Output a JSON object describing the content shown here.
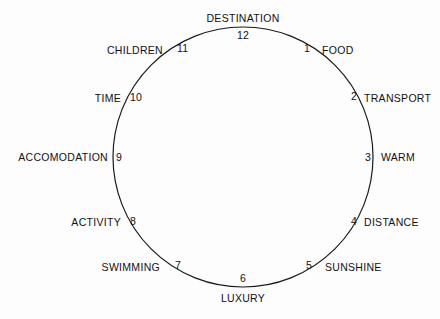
{
  "diagram": {
    "type": "clock-face-circle",
    "title": "",
    "background_color": "#fdfdfd",
    "stroke_color": "#1a1a1a",
    "text_color": "#111111",
    "circle": {
      "cx": 243,
      "cy": 157,
      "r": 130,
      "stroke_width": 1.2
    },
    "positions": [
      {
        "number": "12",
        "label": "DESTINATION",
        "hour": 12,
        "label_x": 243,
        "label_y": 18,
        "label_anchor": "center",
        "num_x": 243,
        "num_y": 35,
        "num_anchor": "center"
      },
      {
        "number": "1",
        "label": "FOOD",
        "hour": 1,
        "label_x": 322,
        "label_y": 50,
        "label_anchor": "left",
        "num_x": 310,
        "num_y": 48,
        "num_anchor": "right"
      },
      {
        "number": "2",
        "label": "TRANSPORT",
        "hour": 2,
        "label_x": 364,
        "label_y": 98,
        "label_anchor": "left",
        "num_x": 357,
        "num_y": 96,
        "num_anchor": "right"
      },
      {
        "number": "3",
        "label": "WARM",
        "hour": 3,
        "label_x": 381,
        "label_y": 157,
        "label_anchor": "left",
        "num_x": 371,
        "num_y": 157,
        "num_anchor": "right"
      },
      {
        "number": "4",
        "label": "DISTANCE",
        "hour": 4,
        "label_x": 364,
        "label_y": 222,
        "label_anchor": "left",
        "num_x": 357,
        "num_y": 221,
        "num_anchor": "right"
      },
      {
        "number": "5",
        "label": "SUNSHINE",
        "hour": 5,
        "label_x": 325,
        "label_y": 267,
        "label_anchor": "left",
        "num_x": 312,
        "num_y": 265,
        "num_anchor": "right"
      },
      {
        "number": "6",
        "label": "LUXURY",
        "hour": 6,
        "label_x": 243,
        "label_y": 298,
        "label_anchor": "center",
        "num_x": 243,
        "num_y": 278,
        "num_anchor": "center"
      },
      {
        "number": "7",
        "label": "SWIMMING",
        "hour": 7,
        "label_x": 160,
        "label_y": 267,
        "label_anchor": "right",
        "num_x": 175,
        "num_y": 265,
        "num_anchor": "left"
      },
      {
        "number": "8",
        "label": "ACTIVITY",
        "hour": 8,
        "label_x": 121,
        "label_y": 222,
        "label_anchor": "right",
        "num_x": 130,
        "num_y": 221,
        "num_anchor": "left"
      },
      {
        "number": "9",
        "label": "ACCOMODATION",
        "hour": 9,
        "label_x": 108,
        "label_y": 157,
        "label_anchor": "right",
        "num_x": 116,
        "num_y": 157,
        "num_anchor": "left"
      },
      {
        "number": "10",
        "label": "TIME",
        "hour": 10,
        "label_x": 121,
        "label_y": 98,
        "label_anchor": "right",
        "num_x": 130,
        "num_y": 97,
        "num_anchor": "left"
      },
      {
        "number": "11",
        "label": "CHILDREN",
        "hour": 11,
        "label_x": 163,
        "label_y": 50,
        "label_anchor": "right",
        "num_x": 177,
        "num_y": 48,
        "num_anchor": "left"
      }
    ]
  }
}
